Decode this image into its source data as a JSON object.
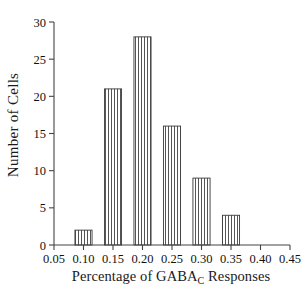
{
  "chart_data": {
    "type": "bar",
    "title": "",
    "subtitle": "",
    "xlabel_prefix": "Percentage of GABA",
    "xlabel_sub": "C",
    "xlabel_suffix": " Responses",
    "xlabel": "Percentage of GABA_C Responses",
    "ylabel": "Number of Cells",
    "xlim": [
      0.05,
      0.45
    ],
    "ylim": [
      0,
      30
    ],
    "xticks": [
      0.05,
      0.1,
      0.15,
      0.2,
      0.25,
      0.3,
      0.35,
      0.4,
      0.45
    ],
    "xticklabels": [
      "0.05",
      "0.10",
      "0.15",
      "0.20",
      "0.25",
      "0.30",
      "0.35",
      "0.40",
      "0.45"
    ],
    "yticks": [
      0,
      5,
      10,
      15,
      20,
      25,
      30
    ],
    "yticklabels": [
      "0",
      "5",
      "10",
      "15",
      "20",
      "25",
      "30"
    ],
    "grid": false,
    "legend": false,
    "bar_fill": "#ffffff",
    "bar_edge": "#3a3a3a",
    "bar_hatch": "vertical-lines",
    "axis_color": "#444444",
    "categories": [
      0.1,
      0.15,
      0.2,
      0.25,
      0.3,
      0.35
    ],
    "values": [
      2,
      21,
      28,
      16,
      9,
      4
    ],
    "bars": [
      {
        "center": 0.1,
        "left": 0.0855,
        "right": 0.1145,
        "value": 2
      },
      {
        "center": 0.15,
        "left": 0.1355,
        "right": 0.1645,
        "value": 21
      },
      {
        "center": 0.2,
        "left": 0.1855,
        "right": 0.2145,
        "value": 28
      },
      {
        "center": 0.25,
        "left": 0.2355,
        "right": 0.2645,
        "value": 16
      },
      {
        "center": 0.3,
        "left": 0.2855,
        "right": 0.3145,
        "value": 9
      },
      {
        "center": 0.35,
        "left": 0.3355,
        "right": 0.3645,
        "value": 4
      }
    ]
  }
}
